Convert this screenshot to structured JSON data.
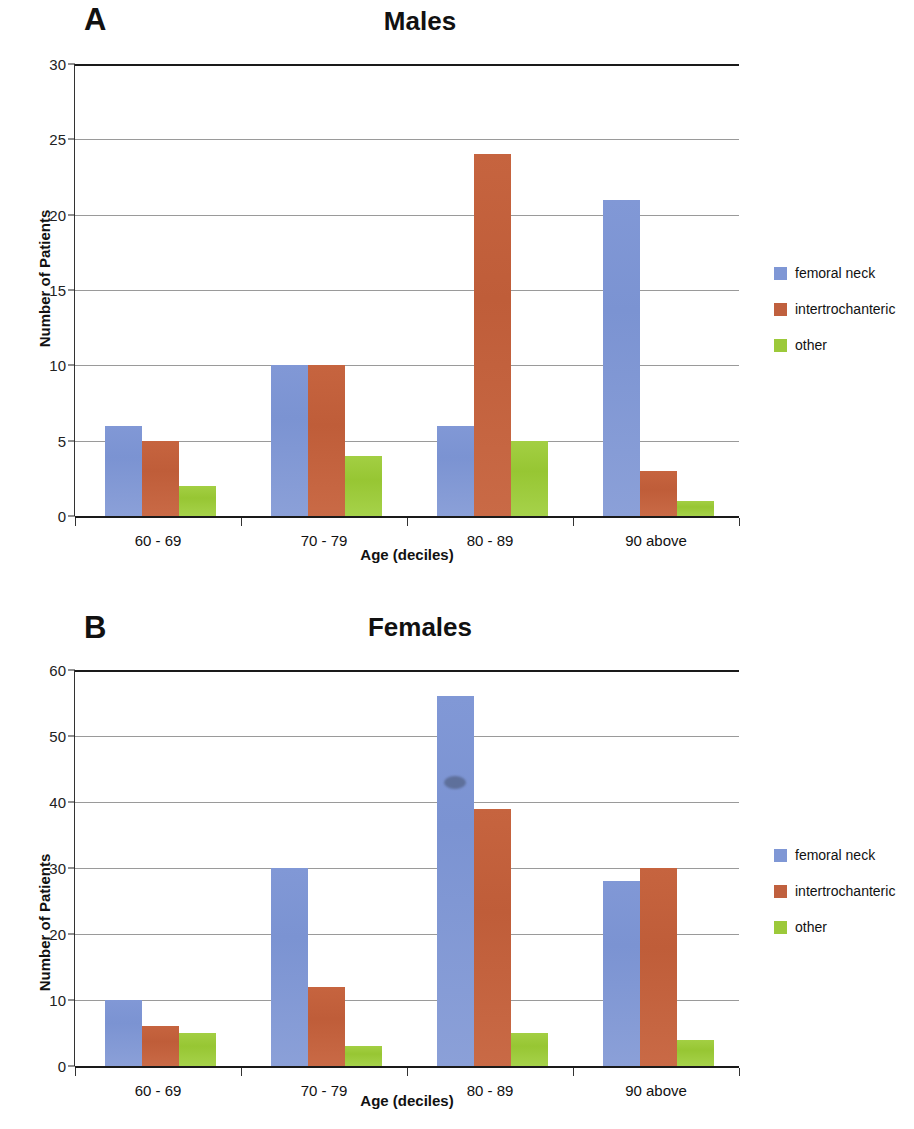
{
  "figure": {
    "background": "#ffffff",
    "colors": {
      "femoral_neck": "#7f97d5",
      "intertrochanteric": "#c0603e",
      "other": "#9cc93a",
      "axis": "#1a1a1a",
      "gridline": "#9a9a9a"
    }
  },
  "panels": [
    {
      "letter": "A",
      "ylabel": "Number of Patients",
      "xlabel": "Age (deciles)"
    },
    {
      "letter": "B",
      "ylabel": "Number of Patients",
      "xlabel": "Age (deciles)"
    }
  ],
  "legend": {
    "items": [
      {
        "label": "femoral neck"
      },
      {
        "label": "intertrochanteric"
      },
      {
        "label": "other"
      }
    ]
  },
  "chart_data": [
    {
      "type": "bar",
      "title": "Males",
      "panel_letter": "A",
      "xlabel": "Age (deciles)",
      "ylabel": "Number of Patients",
      "categories": [
        "60 - 69",
        "70 - 79",
        "80 - 89",
        "90 above"
      ],
      "series": [
        {
          "name": "femoral neck",
          "color": "#7f97d5",
          "values": [
            6,
            10,
            6,
            21
          ]
        },
        {
          "name": "intertrochanteric",
          "color": "#c0603e",
          "values": [
            5,
            10,
            24,
            3
          ]
        },
        {
          "name": "other",
          "color": "#9cc93a",
          "values": [
            2,
            4,
            5,
            1
          ]
        }
      ],
      "ylim": [
        0,
        30
      ],
      "yticks": [
        0,
        5,
        10,
        15,
        20,
        25,
        30
      ],
      "ytick_labels": [
        "0",
        "5",
        "10",
        "15",
        "20",
        "25",
        "30"
      ],
      "grid": true,
      "legend_position": "right"
    },
    {
      "type": "bar",
      "title": "Females",
      "panel_letter": "B",
      "xlabel": "Age (deciles)",
      "ylabel": "Number of Patients",
      "categories": [
        "60 - 69",
        "70 - 79",
        "80 - 89",
        "90 above"
      ],
      "series": [
        {
          "name": "femoral neck",
          "color": "#7f97d5",
          "values": [
            10,
            30,
            56,
            28
          ]
        },
        {
          "name": "intertrochanteric",
          "color": "#c0603e",
          "values": [
            6,
            12,
            39,
            30
          ]
        },
        {
          "name": "other",
          "color": "#9cc93a",
          "values": [
            5,
            3,
            5,
            4
          ]
        }
      ],
      "ylim": [
        0,
        60
      ],
      "yticks": [
        0,
        10,
        20,
        30,
        40,
        50,
        60
      ],
      "ytick_labels": [
        "0",
        "10",
        "20",
        "30",
        "40",
        "50",
        "60"
      ],
      "grid": true,
      "legend_position": "right",
      "annotations": [
        {
          "kind": "scan-smudge",
          "series": "femoral neck",
          "category": "80 - 89",
          "value": 43
        }
      ]
    }
  ]
}
